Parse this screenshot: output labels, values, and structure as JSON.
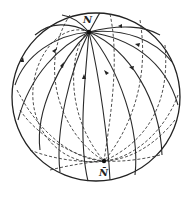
{
  "diagram": {
    "type": "sphere with great circles through two antipodal poles",
    "labels": {
      "top_pole": "N",
      "bottom_pole": "N̄"
    },
    "colors": {
      "line": "#2a2a2a",
      "background": "#ffffff"
    }
  }
}
